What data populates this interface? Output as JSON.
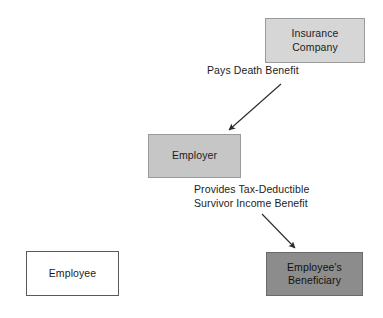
{
  "diagram": {
    "background_color": "#ffffff",
    "text_color": "#1c1c1c",
    "nodes": [
      {
        "id": "insurance-company",
        "label": "Insurance\nCompany",
        "fill": "#d6d6d6",
        "border": "#9a9a9a"
      },
      {
        "id": "employer",
        "label": "Employer",
        "fill": "#c6c6c6",
        "border": "#9a9a9a"
      },
      {
        "id": "employee",
        "label": "Employee",
        "fill": "#ffffff",
        "border": "#5a5a5a"
      },
      {
        "id": "beneficiary",
        "label": "Employee's\nBeneficiary",
        "fill": "#8c8c8c",
        "border": "#6a6a6a"
      }
    ],
    "edges": [
      {
        "id": "pays-death-benefit",
        "label": "Pays Death Benefit",
        "from": "insurance-company",
        "to": "employer",
        "color": "#2b2b2b"
      },
      {
        "id": "provides-survivor-income-benefit",
        "label": "Provides Tax-Deductible\nSurvivor Income Benefit",
        "from": "employer",
        "to": "beneficiary",
        "color": "#2b2b2b"
      }
    ]
  }
}
